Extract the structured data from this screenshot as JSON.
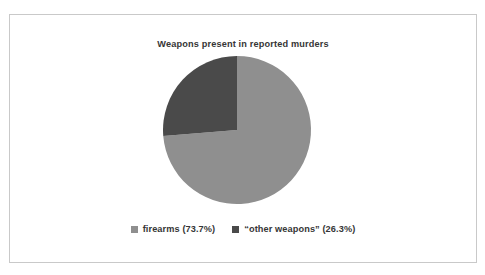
{
  "figure": {
    "title": "Weapons present in reported murders",
    "background_color": "#ffffff",
    "border_color": "#c9c9c9"
  },
  "scan_artifacts": {
    "top_text": "",
    "bottom_text": ""
  },
  "legend": {
    "position": "bottom-center",
    "items": [
      {
        "label": "firearms (73.7%)",
        "color": "#8f8f8f",
        "swatch_name": "legend-swatch-firearms"
      },
      {
        "label": "“other weapons” (26.3%)",
        "color": "#4a4a4a",
        "swatch_name": "legend-swatch-other-weapons"
      }
    ]
  },
  "chart_data": {
    "type": "pie",
    "title": "Weapons present in reported murders",
    "xlabel": "",
    "ylabel": "",
    "categories": [
      "firearms",
      "“other weapons”"
    ],
    "values": [
      73.7,
      26.3
    ],
    "value_unit": "percent",
    "labels": [
      "firearms (73.7%)",
      "“other weapons” (26.3%)"
    ],
    "colors": [
      "#8f8f8f",
      "#4a4a4a"
    ],
    "start_angle_deg": 90,
    "direction": "counterclockwise",
    "grid": false,
    "legend_position": "bottom",
    "slices": [
      {
        "name": "firearms",
        "value": 73.7,
        "color": "#8f8f8f",
        "angle_deg": 265.32
      },
      {
        "name": "“other weapons”",
        "value": 26.3,
        "color": "#4a4a4a",
        "angle_deg": 94.68
      }
    ]
  }
}
